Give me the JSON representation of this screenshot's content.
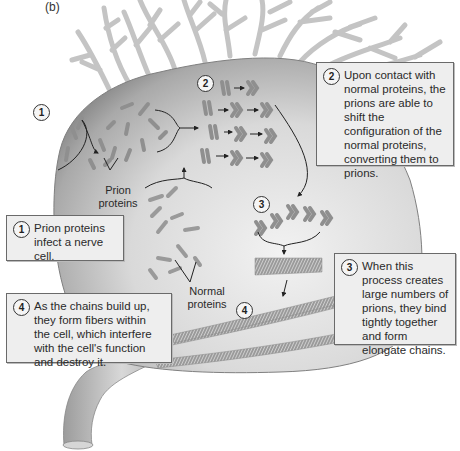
{
  "figure": {
    "panel_label": "(b)"
  },
  "steps": [
    {
      "number": "1",
      "text": "Prion proteins infect a nerve cell."
    },
    {
      "number": "2",
      "text": "Upon contact with normal proteins, the prions are able to shift the configuration of the normal proteins, converting them to prions."
    },
    {
      "number": "3",
      "text": "When this process creates large numbers of prions, they bind tightly together and form elongate chains."
    },
    {
      "number": "4",
      "text": "As the chains build up, they form fibers within the cell, which interfere with the cell's function and destroy it."
    }
  ],
  "labels": {
    "prion_proteins_line1": "Prion",
    "prion_proteins_line2": "proteins",
    "normal_proteins_line1": "Normal",
    "normal_proteins_line2": "proteins"
  },
  "markers": {
    "m1": "1",
    "m2": "2",
    "m3": "3",
    "m4": "4"
  },
  "colors": {
    "cell_dark": "#7d7d7d",
    "cell_light": "#e6e6e6",
    "dendrite": "#c4c4c4",
    "protein": "#8f8f8f",
    "callout_bg": "#eeeeee",
    "callout_border": "#6a6a6a"
  }
}
